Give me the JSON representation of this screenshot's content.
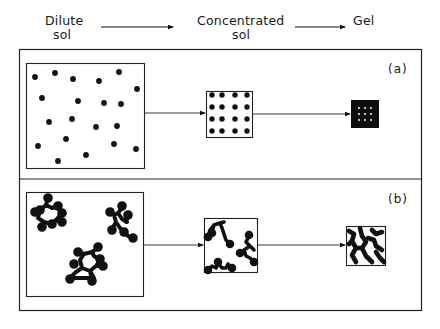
{
  "header": {
    "stages": [
      {
        "line1": "Dilute",
        "line2": "sol"
      },
      {
        "line1": "Concentrated",
        "line2": "sol"
      },
      {
        "line1": "Gel",
        "line2": ""
      }
    ]
  },
  "panels": [
    {
      "tag": "(a)",
      "description": "Dispersed individual particles: dilute sol -> ordered concentrated sol -> dense gel"
    },
    {
      "tag": "(b)",
      "description": "Aggregated clusters: dilute sol -> concentrated sol of chains -> network gel"
    }
  ],
  "colors": {
    "ink": "#111111",
    "paper": "#ffffff"
  },
  "geometry": {
    "frame": [
      19,
      49,
      403,
      262
    ],
    "divider_y": 179,
    "panel_a": {
      "dilute_box": [
        26,
        63,
        118,
        105
      ],
      "dilute_dots": [
        [
          35,
          77
        ],
        [
          55,
          73
        ],
        [
          73,
          79
        ],
        [
          99,
          81
        ],
        [
          119,
          72
        ],
        [
          137,
          89
        ],
        [
          42,
          98
        ],
        [
          78,
          101
        ],
        [
          104,
          103
        ],
        [
          121,
          104
        ],
        [
          49,
          122
        ],
        [
          72,
          119
        ],
        [
          96,
          127
        ],
        [
          117,
          126
        ],
        [
          38,
          146
        ],
        [
          66,
          139
        ],
        [
          114,
          144
        ],
        [
          136,
          149
        ],
        [
          58,
          161
        ],
        [
          86,
          155
        ]
      ],
      "conc_box": [
        206,
        91,
        46,
        46
      ],
      "conc_grid": {
        "xs": [
          212,
          222,
          235,
          247
        ],
        "ys": [
          95,
          107,
          119,
          131
        ]
      },
      "gel_box": [
        351,
        100,
        28,
        28
      ],
      "arrow_y": 129
    },
    "panel_b": {
      "dilute_box": [
        26,
        192,
        117,
        104
      ],
      "conc_box": [
        204,
        218,
        53,
        54
      ],
      "gel_box": [
        346,
        226,
        39,
        39
      ],
      "arrow_y": 245
    }
  }
}
